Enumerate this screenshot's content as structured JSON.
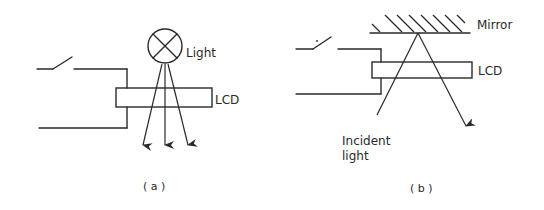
{
  "figure": {
    "panel_a": {
      "caption": "( a )",
      "lamp_label": "Light",
      "lcd_label": "LCD",
      "components": [
        "switch",
        "wires",
        "lamp",
        "LCD panel",
        "transmitted light rays (3)"
      ]
    },
    "panel_b": {
      "caption": "( b )",
      "mirror_label": "Mirror",
      "lcd_label": "LCD",
      "incident_label_line1": "Incident",
      "incident_label_line2": "light",
      "components": [
        "switch",
        "wires",
        "mirror",
        "LCD panel",
        "incident and reflected ray"
      ]
    }
  },
  "colors": {
    "ink": "#2a2a2a",
    "background": "#ffffff"
  }
}
